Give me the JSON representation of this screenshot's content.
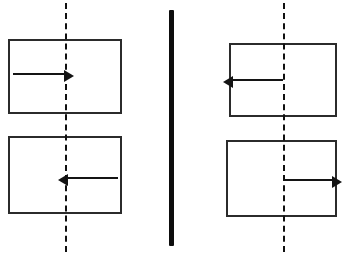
{
  "figure": {
    "width": 348,
    "height": 261,
    "background_color": "#ffffff",
    "line_color": "#2b2b2b",
    "arrow_color": "#141414",
    "axis_color": "#111111",
    "divider_color": "#0d0d0d"
  },
  "divider": {
    "label": "vertical separator bar",
    "x": 169,
    "y": 10,
    "width": 5,
    "height": 236
  },
  "panels": [
    {
      "id": "left",
      "label": "left panel",
      "axis": {
        "label": "dashed symmetry axis",
        "x": 65,
        "y_top": 3,
        "y_bottom": 252
      },
      "boxes": [
        {
          "id": "left-top",
          "label": "rectangle top left",
          "x": 8,
          "y": 39,
          "width": 114,
          "height": 75,
          "arrow": {
            "label": "arrow pointing right toward axis",
            "direction": "right",
            "x": 13,
            "y": 73,
            "length": 52
          }
        },
        {
          "id": "left-bottom",
          "label": "rectangle bottom left",
          "x": 8,
          "y": 136,
          "width": 114,
          "height": 78,
          "arrow": {
            "label": "arrow pointing left toward axis",
            "direction": "left",
            "x": 67,
            "y": 177,
            "length": 51
          }
        }
      ]
    },
    {
      "id": "right",
      "label": "right panel",
      "axis": {
        "label": "dashed symmetry axis",
        "x": 283,
        "y_top": 3,
        "y_bottom": 252
      },
      "boxes": [
        {
          "id": "right-top",
          "label": "rectangle top right",
          "x": 229,
          "y": 43,
          "width": 108,
          "height": 74,
          "arrow": {
            "label": "arrow pointing left away from axis",
            "direction": "left",
            "x": 232,
            "y": 79,
            "length": 51
          }
        },
        {
          "id": "right-bottom",
          "label": "rectangle bottom right",
          "x": 226,
          "y": 140,
          "width": 111,
          "height": 77,
          "arrow": {
            "label": "arrow pointing right away from axis",
            "direction": "right",
            "x": 283,
            "y": 179,
            "length": 50
          }
        }
      ]
    }
  ]
}
